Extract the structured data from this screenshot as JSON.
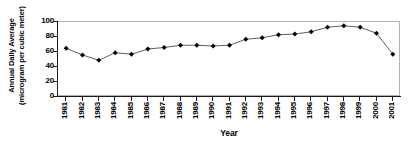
{
  "chart_data": {
    "type": "line",
    "title": "",
    "xlabel": "Year",
    "ylabel": "Annual Daily Average (microgram per cubic meter)",
    "ylabel_lines": [
      "Annual Daily Average",
      "(microgram per cubic meter)"
    ],
    "categories": [
      "1981",
      "1982",
      "1983",
      "1984",
      "1985",
      "1986",
      "1987",
      "1988",
      "1989",
      "1990",
      "1991",
      "1992",
      "1993",
      "1994",
      "1995",
      "1996",
      "1997",
      "1998",
      "1999",
      "2000",
      "2001"
    ],
    "values": [
      65,
      56,
      49,
      59,
      57,
      64,
      66,
      69,
      69,
      68,
      69,
      77,
      79,
      83,
      84,
      87,
      93,
      95,
      93,
      85,
      57
    ],
    "series": [
      {
        "name": "Annual Daily Average",
        "values": [
          65,
          56,
          49,
          59,
          57,
          64,
          66,
          69,
          69,
          68,
          69,
          77,
          79,
          83,
          84,
          87,
          93,
          95,
          93,
          85,
          57
        ]
      }
    ],
    "ylim": [
      0,
      100
    ],
    "yticks": [
      0,
      20,
      40,
      60,
      80,
      100
    ],
    "ytick_labels": [
      "0",
      "20",
      "40",
      "60",
      "80",
      "100"
    ],
    "grid": false,
    "legend": "none",
    "marker": "diamond",
    "marker_color": "#000000",
    "line_color": "#4d4d4d",
    "axis_color": "#1a1a1a",
    "frame_color": "#b3b3b3"
  }
}
